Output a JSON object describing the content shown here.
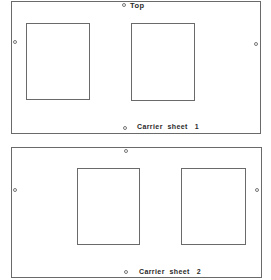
{
  "diagram": {
    "type": "carrier-sheet-layout",
    "colors": {
      "line": "#6a6a6a",
      "text": "#2a2a2a",
      "background": "#ffffff"
    },
    "sheets": [
      {
        "id": "sheet-1",
        "label": "Carrier  sheet   1",
        "top_label": "Top",
        "holes": [
          "top",
          "left",
          "right",
          "bottom"
        ],
        "windows": 2
      },
      {
        "id": "sheet-2",
        "label": "Carrier  sheet   2",
        "holes": [
          "top",
          "left",
          "right",
          "bottom"
        ],
        "windows": 2
      }
    ]
  }
}
